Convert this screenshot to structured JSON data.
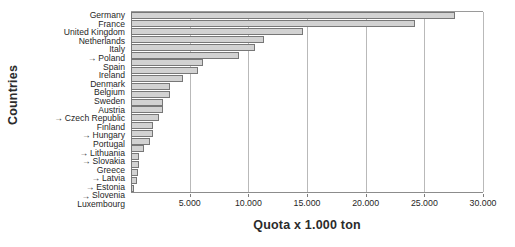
{
  "chart_data": {
    "type": "bar",
    "orientation": "horizontal",
    "title": "",
    "xlabel": "Quota x 1.000 ton",
    "ylabel": "Countries",
    "xlim": [
      0,
      30000
    ],
    "xticks": [
      5000,
      10000,
      15000,
      20000,
      25000,
      30000
    ],
    "xticklabels": [
      "5.000",
      "10.000",
      "15.000",
      "20.000",
      "25.000",
      "30.000"
    ],
    "grid": true,
    "legend": "none",
    "marker_symbol": "→",
    "marker_note": "arrow prefix marks new EU member states",
    "categories": [
      "Germany",
      "France",
      "United Kingdom",
      "Netherlands",
      "Italy",
      "Poland",
      "Spain",
      "Ireland",
      "Denmark",
      "Belgium",
      "Sweden",
      "Austria",
      "Czech Republic",
      "Finland",
      "Hungary",
      "Portugal",
      "Lithuania",
      "Slovakia",
      "Greece",
      "Latvia",
      "Estonia",
      "Slovenia",
      "Luxembourg"
    ],
    "marked": [
      false,
      false,
      false,
      false,
      false,
      true,
      false,
      false,
      false,
      false,
      false,
      false,
      true,
      false,
      true,
      false,
      true,
      true,
      false,
      true,
      true,
      true,
      false
    ],
    "values": [
      27600,
      24200,
      14700,
      11300,
      10600,
      9200,
      6100,
      5700,
      4400,
      3300,
      3300,
      2700,
      2700,
      2400,
      1900,
      1900,
      1600,
      1100,
      700,
      700,
      600,
      550,
      270
    ],
    "bar_fill": "#d2d2d2",
    "bar_edge": "#777777",
    "grid_color": "#b9b9b9",
    "background": "#ffffff"
  }
}
